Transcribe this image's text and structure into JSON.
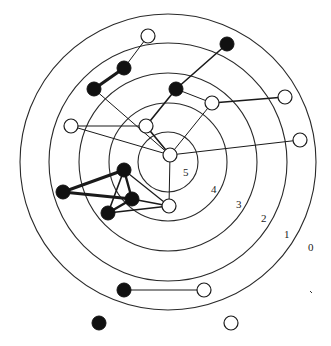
{
  "diagram": {
    "type": "concentric-core-graph",
    "center": [
      168,
      162
    ],
    "rings": [
      {
        "level": "5",
        "radius": 30
      },
      {
        "level": "4",
        "radius": 59
      },
      {
        "level": "3",
        "radius": 89
      },
      {
        "level": "2",
        "radius": 119
      },
      {
        "level": "1",
        "radius": 148
      }
    ],
    "ring_labels": [
      {
        "text": "5",
        "x": 183,
        "y": 176
      },
      {
        "text": "4",
        "x": 211,
        "y": 193
      },
      {
        "text": "3",
        "x": 236,
        "y": 208
      },
      {
        "text": "2",
        "x": 261,
        "y": 222
      },
      {
        "text": "1",
        "x": 284,
        "y": 238
      },
      {
        "text": "0",
        "x": 308,
        "y": 251
      }
    ],
    "node_colors": {
      "filled": "#111111",
      "open": "#ffffff"
    },
    "nodes": [
      {
        "id": "n1",
        "x": 148,
        "y": 36,
        "kind": "open"
      },
      {
        "id": "n2",
        "x": 227,
        "y": 44,
        "kind": "filled"
      },
      {
        "id": "n3",
        "x": 124,
        "y": 68,
        "kind": "filled"
      },
      {
        "id": "n4",
        "x": 94,
        "y": 89,
        "kind": "filled"
      },
      {
        "id": "n5",
        "x": 176,
        "y": 89,
        "kind": "filled"
      },
      {
        "id": "n6",
        "x": 212,
        "y": 103,
        "kind": "open"
      },
      {
        "id": "n7",
        "x": 285,
        "y": 97,
        "kind": "open"
      },
      {
        "id": "n8",
        "x": 71,
        "y": 126,
        "kind": "open"
      },
      {
        "id": "n9",
        "x": 146,
        "y": 126,
        "kind": "open"
      },
      {
        "id": "n10",
        "x": 300,
        "y": 140,
        "kind": "open"
      },
      {
        "id": "n11",
        "x": 170,
        "y": 155,
        "kind": "open"
      },
      {
        "id": "n12",
        "x": 124,
        "y": 170,
        "kind": "filled"
      },
      {
        "id": "n13",
        "x": 63,
        "y": 192,
        "kind": "filled"
      },
      {
        "id": "n14",
        "x": 132,
        "y": 199,
        "kind": "filled"
      },
      {
        "id": "n15",
        "x": 108,
        "y": 213,
        "kind": "filled"
      },
      {
        "id": "n16",
        "x": 169,
        "y": 206,
        "kind": "open"
      },
      {
        "id": "n17",
        "x": 124,
        "y": 290,
        "kind": "filled"
      },
      {
        "id": "n18",
        "x": 204,
        "y": 290,
        "kind": "open"
      },
      {
        "id": "n19",
        "x": 99,
        "y": 323,
        "kind": "filled"
      },
      {
        "id": "n20",
        "x": 231,
        "y": 323,
        "kind": "open"
      }
    ],
    "edges": [
      {
        "from": "n1",
        "to": "n3",
        "w": 1
      },
      {
        "from": "n3",
        "to": "n4",
        "w": 3.2
      },
      {
        "from": "n2",
        "to": "n5",
        "w": 1.6
      },
      {
        "from": "n5",
        "to": "n9",
        "w": 1.6
      },
      {
        "from": "n5",
        "to": "n6",
        "w": 1
      },
      {
        "from": "n6",
        "to": "n7",
        "w": 1.6
      },
      {
        "from": "n6",
        "to": "n11",
        "w": 1
      },
      {
        "from": "n4",
        "to": "n11",
        "w": 1
      },
      {
        "from": "n8",
        "to": "n9",
        "w": 1.2
      },
      {
        "from": "n8",
        "to": "n11",
        "w": 1
      },
      {
        "from": "n9",
        "to": "n11",
        "w": 1.6
      },
      {
        "from": "n11",
        "to": "n10",
        "w": 1
      },
      {
        "from": "n11",
        "to": "n16",
        "w": 1
      },
      {
        "from": "n12",
        "to": "n13",
        "w": 3
      },
      {
        "from": "n13",
        "to": "n14",
        "w": 3
      },
      {
        "from": "n12",
        "to": "n14",
        "w": 2.4
      },
      {
        "from": "n12",
        "to": "n15",
        "w": 1.6
      },
      {
        "from": "n14",
        "to": "n15",
        "w": 2.4
      },
      {
        "from": "n12",
        "to": "n16",
        "w": 1.2
      },
      {
        "from": "n14",
        "to": "n16",
        "w": 1.6
      },
      {
        "from": "n15",
        "to": "n16",
        "w": 1.6
      },
      {
        "from": "n17",
        "to": "n18",
        "w": 1
      }
    ],
    "stray_mark": {
      "x": 311,
      "y": 292
    }
  }
}
